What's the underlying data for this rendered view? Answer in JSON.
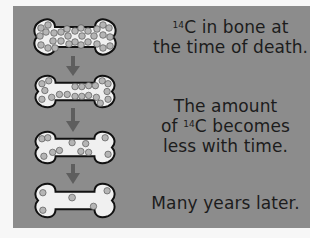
{
  "diagram": {
    "colors": {
      "panel_background": "#8c8c8c",
      "page_background": "#f7f7f7",
      "bone_fill": "#f0f0f0",
      "bone_outline": "#111111",
      "atom_fill": "#b5b5b5",
      "arrow": "#5e5e5e",
      "text": "#1c1c1c"
    },
    "stages": [
      {
        "name": "bone-stage-1",
        "atom_count": 30,
        "description": "many 14C atoms"
      },
      {
        "name": "bone-stage-2",
        "atom_count": 20,
        "description": "fewer 14C atoms"
      },
      {
        "name": "bone-stage-3",
        "atom_count": 11,
        "description": "even fewer 14C atoms"
      },
      {
        "name": "bone-stage-4",
        "atom_count": 4,
        "description": "few 14C atoms remain"
      }
    ],
    "captions": [
      {
        "isotope_mass": "14",
        "line1_rest": "C in bone at",
        "line2": "the time of death."
      },
      {
        "line1": "The amount",
        "line2_pre": "of ",
        "isotope_mass": "14",
        "line2_post": "C becomes",
        "line3": "less with time."
      },
      {
        "line1": "Many years later."
      }
    ]
  }
}
